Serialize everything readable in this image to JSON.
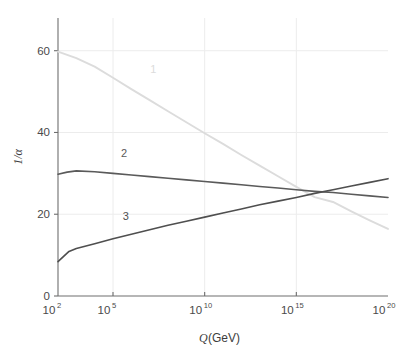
{
  "chart_data": {
    "type": "line",
    "title": "",
    "xlabel": "Q (GeV)",
    "ylabel": "1/α",
    "xscale": "log10",
    "xlim": [
      2,
      20
    ],
    "ylim": [
      0,
      68
    ],
    "grid": true,
    "grid_x_values": [
      "10^5",
      "10^10",
      "10^15"
    ],
    "grid_y_values": [
      20,
      40,
      60
    ],
    "xticks": [
      {
        "exp": "2",
        "base": "10",
        "label": "10²",
        "value": 2
      },
      {
        "exp": "5",
        "base": "10",
        "label": "10⁵",
        "value": 5
      },
      {
        "exp": "10",
        "base": "10",
        "label": "10¹⁰",
        "value": 10
      },
      {
        "exp": "15",
        "base": "10",
        "label": "10¹⁵",
        "value": 15
      },
      {
        "exp": "20",
        "base": "10",
        "label": "10²⁰",
        "value": 20
      }
    ],
    "yticks": [
      {
        "label": "0",
        "value": 0
      },
      {
        "label": "20",
        "value": 20
      },
      {
        "label": "40",
        "value": 40
      },
      {
        "label": "60",
        "value": 60
      }
    ],
    "legend_position": "inline-annotations",
    "series": [
      {
        "name": "1",
        "annotation_label": "1",
        "color": "#dcdcdc",
        "annotation_x": 7.2,
        "annotation_y": 54.5,
        "points": [
          {
            "x": 2,
            "y": 59.8
          },
          {
            "x": 3,
            "y": 58.2
          },
          {
            "x": 4,
            "y": 56.1
          },
          {
            "x": 5,
            "y": 53.4
          },
          {
            "x": 6,
            "y": 50.6
          },
          {
            "x": 7,
            "y": 47.9
          },
          {
            "x": 8,
            "y": 45.2
          },
          {
            "x": 9,
            "y": 42.5
          },
          {
            "x": 10,
            "y": 39.8
          },
          {
            "x": 11,
            "y": 37.2
          },
          {
            "x": 12,
            "y": 34.5
          },
          {
            "x": 13,
            "y": 31.9
          },
          {
            "x": 14,
            "y": 29.3
          },
          {
            "x": 15,
            "y": 26.7
          },
          {
            "x": 16,
            "y": 24.2
          },
          {
            "x": 17,
            "y": 23.0
          },
          {
            "x": 18,
            "y": 20.7
          },
          {
            "x": 19,
            "y": 18.5
          },
          {
            "x": 20,
            "y": 16.4
          }
        ]
      },
      {
        "name": "2",
        "annotation_label": "2",
        "color": "#5a5a5a",
        "annotation_x": 5.6,
        "annotation_y": 34.0,
        "points": [
          {
            "x": 2,
            "y": 29.8
          },
          {
            "x": 2.5,
            "y": 30.3
          },
          {
            "x": 3,
            "y": 30.6
          },
          {
            "x": 4,
            "y": 30.4
          },
          {
            "x": 5,
            "y": 30.0
          },
          {
            "x": 6,
            "y": 29.6
          },
          {
            "x": 7,
            "y": 29.2
          },
          {
            "x": 8,
            "y": 28.8
          },
          {
            "x": 9,
            "y": 28.4
          },
          {
            "x": 10,
            "y": 28.0
          },
          {
            "x": 11,
            "y": 27.6
          },
          {
            "x": 12,
            "y": 27.2
          },
          {
            "x": 13,
            "y": 26.8
          },
          {
            "x": 14,
            "y": 26.4
          },
          {
            "x": 15,
            "y": 26.0
          },
          {
            "x": 16,
            "y": 25.6
          },
          {
            "x": 17,
            "y": 25.3
          },
          {
            "x": 18,
            "y": 24.9
          },
          {
            "x": 19,
            "y": 24.5
          },
          {
            "x": 20,
            "y": 24.1
          }
        ]
      },
      {
        "name": "3",
        "annotation_label": "3",
        "color": "#4f4f4f",
        "annotation_x": 5.7,
        "annotation_y": 18.6,
        "points": [
          {
            "x": 2,
            "y": 8.4
          },
          {
            "x": 2.6,
            "y": 10.9
          },
          {
            "x": 3,
            "y": 11.6
          },
          {
            "x": 4,
            "y": 12.8
          },
          {
            "x": 5,
            "y": 14.0
          },
          {
            "x": 6,
            "y": 15.1
          },
          {
            "x": 7,
            "y": 16.2
          },
          {
            "x": 8,
            "y": 17.3
          },
          {
            "x": 9,
            "y": 18.3
          },
          {
            "x": 10,
            "y": 19.3
          },
          {
            "x": 11,
            "y": 20.3
          },
          {
            "x": 12,
            "y": 21.3
          },
          {
            "x": 13,
            "y": 22.3
          },
          {
            "x": 14,
            "y": 23.2
          },
          {
            "x": 15,
            "y": 24.1
          },
          {
            "x": 16,
            "y": 25.1
          },
          {
            "x": 17,
            "y": 26.0
          },
          {
            "x": 18,
            "y": 26.9
          },
          {
            "x": 19,
            "y": 27.8
          },
          {
            "x": 20,
            "y": 28.7
          }
        ]
      }
    ],
    "colors": {
      "series1": "#dcdcdc",
      "series2": "#5a5a5a",
      "series3": "#4f4f4f",
      "axis": "#6e6e6e",
      "grid": "#ececec",
      "text": "#4a4a4a",
      "background": "#ffffff"
    }
  }
}
